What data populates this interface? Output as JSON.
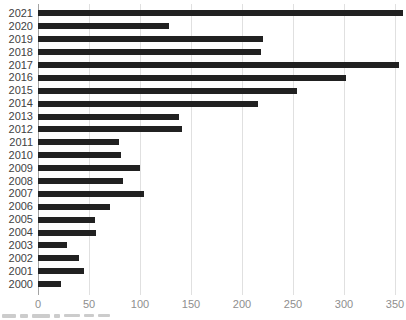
{
  "chart_data": {
    "type": "bar",
    "orientation": "horizontal",
    "title": "",
    "xlabel": "",
    "ylabel": "",
    "categories": [
      "2021",
      "2020",
      "2019",
      "2018",
      "2017",
      "2016",
      "2015",
      "2014",
      "2013",
      "2012",
      "2011",
      "2010",
      "2009",
      "2008",
      "2007",
      "2006",
      "2005",
      "2004",
      "2003",
      "2002",
      "2001",
      "2000"
    ],
    "values": [
      358,
      128,
      221,
      219,
      354,
      302,
      254,
      216,
      138,
      141,
      79,
      81,
      100,
      83,
      104,
      71,
      56,
      57,
      28,
      40,
      45,
      23
    ],
    "x_ticks": [
      "0",
      "50",
      "100",
      "150",
      "200",
      "250",
      "300",
      "350"
    ],
    "x_tick_values": [
      0,
      50,
      100,
      150,
      200,
      250,
      300,
      350
    ],
    "xlim": [
      0,
      360
    ],
    "grid": "vertical-only",
    "legend": "none"
  },
  "colors": {
    "bar": "#212121",
    "gridline": "#e0e0e0",
    "axis_line": "#a3a3a3",
    "y_label": "#3f3f3f",
    "x_label": "#8e8e8e",
    "background": "#ffffff"
  }
}
